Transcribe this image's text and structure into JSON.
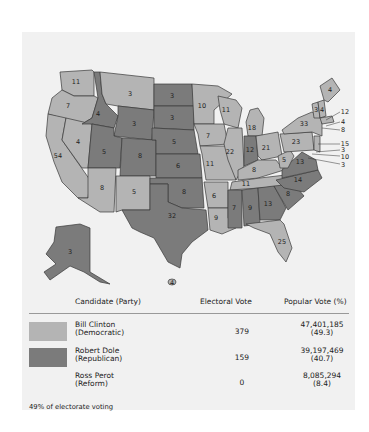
{
  "map": {
    "title": "1996 Presidential Election",
    "colors": {
      "democratic": "#b4b4b4",
      "republican": "#7b7b7b"
    },
    "states": [
      {
        "abbr": "WA",
        "ev": "11",
        "party": "D"
      },
      {
        "abbr": "OR",
        "ev": "7",
        "party": "D"
      },
      {
        "abbr": "CA",
        "ev": "54",
        "party": "D"
      },
      {
        "abbr": "NV",
        "ev": "4",
        "party": "D"
      },
      {
        "abbr": "ID",
        "ev": "4",
        "party": "R"
      },
      {
        "abbr": "MT",
        "ev": "3",
        "party": "D"
      },
      {
        "abbr": "WY",
        "ev": "3",
        "party": "R"
      },
      {
        "abbr": "UT",
        "ev": "5",
        "party": "R"
      },
      {
        "abbr": "AZ",
        "ev": "8",
        "party": "D"
      },
      {
        "abbr": "CO",
        "ev": "8",
        "party": "R"
      },
      {
        "abbr": "NM",
        "ev": "5",
        "party": "D"
      },
      {
        "abbr": "ND",
        "ev": "3",
        "party": "R"
      },
      {
        "abbr": "SD",
        "ev": "3",
        "party": "R"
      },
      {
        "abbr": "NE",
        "ev": "5",
        "party": "R"
      },
      {
        "abbr": "KS",
        "ev": "6",
        "party": "R"
      },
      {
        "abbr": "OK",
        "ev": "8",
        "party": "R"
      },
      {
        "abbr": "TX",
        "ev": "32",
        "party": "R"
      },
      {
        "abbr": "MN",
        "ev": "10",
        "party": "D"
      },
      {
        "abbr": "IA",
        "ev": "7",
        "party": "D"
      },
      {
        "abbr": "MO",
        "ev": "11",
        "party": "D"
      },
      {
        "abbr": "AR",
        "ev": "6",
        "party": "D"
      },
      {
        "abbr": "LA",
        "ev": "9",
        "party": "D"
      },
      {
        "abbr": "WI",
        "ev": "11",
        "party": "D"
      },
      {
        "abbr": "IL",
        "ev": "22",
        "party": "D"
      },
      {
        "abbr": "MI",
        "ev": "18",
        "party": "D"
      },
      {
        "abbr": "IN",
        "ev": "12",
        "party": "R"
      },
      {
        "abbr": "OH",
        "ev": "21",
        "party": "D"
      },
      {
        "abbr": "KY",
        "ev": "8",
        "party": "D"
      },
      {
        "abbr": "TN",
        "ev": "11",
        "party": "D"
      },
      {
        "abbr": "MS",
        "ev": "7",
        "party": "R"
      },
      {
        "abbr": "AL",
        "ev": "9",
        "party": "R"
      },
      {
        "abbr": "GA",
        "ev": "13",
        "party": "R"
      },
      {
        "abbr": "FL",
        "ev": "25",
        "party": "D"
      },
      {
        "abbr": "SC",
        "ev": "8",
        "party": "R"
      },
      {
        "abbr": "NC",
        "ev": "14",
        "party": "R"
      },
      {
        "abbr": "VA",
        "ev": "13",
        "party": "R"
      },
      {
        "abbr": "WV",
        "ev": "5",
        "party": "D"
      },
      {
        "abbr": "PA",
        "ev": "23",
        "party": "D"
      },
      {
        "abbr": "NY",
        "ev": "33",
        "party": "D"
      },
      {
        "abbr": "VT",
        "ev": "3",
        "party": "D"
      },
      {
        "abbr": "NH",
        "ev": "4",
        "party": "D"
      },
      {
        "abbr": "ME",
        "ev": "4",
        "party": "D"
      },
      {
        "abbr": "MA",
        "ev": "12",
        "party": "D"
      },
      {
        "abbr": "RI",
        "ev": "4",
        "party": "D"
      },
      {
        "abbr": "CT",
        "ev": "8",
        "party": "D"
      },
      {
        "abbr": "NJ",
        "ev": "15",
        "party": "D"
      },
      {
        "abbr": "DE",
        "ev": "3",
        "party": "D"
      },
      {
        "abbr": "MD",
        "ev": "10",
        "party": "D"
      },
      {
        "abbr": "DC",
        "ev": "3",
        "party": "D"
      },
      {
        "abbr": "AK",
        "ev": "3",
        "party": "R"
      },
      {
        "abbr": "HI",
        "ev": "4",
        "party": "D"
      }
    ]
  },
  "table": {
    "headers": {
      "candidate": "Candidate (Party)",
      "electoral": "Electoral Vote",
      "popular": "Popular Vote (%)"
    },
    "rows": [
      {
        "name": "Bill Clinton",
        "party": "(Democratic)",
        "electoral": "379",
        "popular": "47,401,185",
        "percent": "(49.3)",
        "color": "#b4b4b4"
      },
      {
        "name": "Robert Dole",
        "party": "(Republican)",
        "electoral": "159",
        "popular": "39,197,469",
        "percent": "(40.7)",
        "color": "#7b7b7b"
      },
      {
        "name": "Ross Perot",
        "party": "(Reform)",
        "electoral": "0",
        "popular": "8,085,294",
        "percent": "(8.4)",
        "color": ""
      }
    ],
    "note": "49% of electorate voting"
  }
}
